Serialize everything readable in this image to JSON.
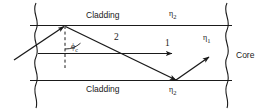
{
  "figure": {
    "background_color": "#ffffff",
    "line_color": "#1a1a1a",
    "text_color": "#1a1a1a",
    "width": 261,
    "height": 111
  },
  "labels": {
    "cladding_top": "Cladding",
    "cladding_bottom": "Cladding",
    "core": "Core",
    "index_cladding_top": "η",
    "index_cladding_top_sub": "2",
    "index_core": "η",
    "index_core_sub": "1",
    "index_cladding_bottom": "η",
    "index_cladding_bottom_sub": "2",
    "ray_one": "1",
    "ray_two": "2",
    "critical_angle": "ϕ",
    "critical_angle_sub": "c"
  }
}
